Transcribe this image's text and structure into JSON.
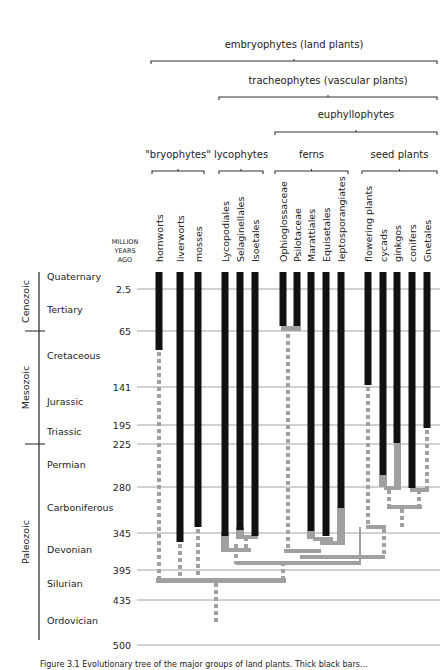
{
  "clades": [
    {
      "id": "embryophytes",
      "label": "embryophytes (land plants)",
      "x1": 151,
      "x2": 437,
      "y": 61,
      "label_y": 48
    },
    {
      "id": "tracheophytes",
      "label": "tracheophytes (vascular plants)",
      "x1": 219,
      "x2": 437,
      "y": 97,
      "label_y": 84
    },
    {
      "id": "euphyllophytes",
      "label": "euphyllophytes",
      "x1": 275,
      "x2": 437,
      "y": 132,
      "label_y": 118
    },
    {
      "id": "bryophytes",
      "label": "\"bryophytes\"",
      "x1": 152,
      "x2": 204,
      "y": 171,
      "label_y": 158
    },
    {
      "id": "lycophytes",
      "label": "lycophytes",
      "x1": 219,
      "x2": 263,
      "y": 171,
      "label_y": 158
    },
    {
      "id": "ferns",
      "label": "ferns",
      "x1": 275,
      "x2": 348,
      "y": 171,
      "label_y": 158
    },
    {
      "id": "seed-plants",
      "label": "seed plants",
      "x1": 362,
      "x2": 437,
      "y": 171,
      "label_y": 158
    }
  ],
  "axis": {
    "header": [
      "MILLION",
      "YEARS",
      "AGO"
    ],
    "ticks": [
      {
        "label": "2.5",
        "y": 289
      },
      {
        "label": "65",
        "y": 331
      },
      {
        "label": "141",
        "y": 387
      },
      {
        "label": "195",
        "y": 425
      },
      {
        "label": "225",
        "y": 444
      },
      {
        "label": "280",
        "y": 487
      },
      {
        "label": "345",
        "y": 533
      },
      {
        "label": "395",
        "y": 570
      },
      {
        "label": "435",
        "y": 600
      },
      {
        "label": "500",
        "y": 645
      }
    ]
  },
  "eras": [
    {
      "label": "Cenozoic",
      "y1": 272,
      "y2": 331
    },
    {
      "label": "Mesozoic",
      "y1": 331,
      "y2": 444
    },
    {
      "label": "Paleozoic",
      "y1": 444,
      "y2": 640
    }
  ],
  "periods": [
    {
      "label": "Quaternary",
      "y": 280
    },
    {
      "label": "Tertiary",
      "y": 313
    },
    {
      "label": "Cretaceous",
      "y": 359
    },
    {
      "label": "Jurassic",
      "y": 405
    },
    {
      "label": "Triassic",
      "y": 435
    },
    {
      "label": "Permian",
      "y": 468
    },
    {
      "label": "Carboniferous",
      "y": 511
    },
    {
      "label": "Devonian",
      "y": 553
    },
    {
      "label": "Silurian",
      "y": 587
    },
    {
      "label": "Ordovician",
      "y": 624
    }
  ],
  "taxa": [
    {
      "label": "hornworts",
      "x": 159,
      "bar_end": 350
    },
    {
      "label": "liverworts",
      "x": 180,
      "bar_end": 542
    },
    {
      "label": "mosses",
      "x": 198,
      "bar_end": 527
    },
    {
      "label": "Lycopodiales",
      "x": 225,
      "bar_end": 536
    },
    {
      "label": "Selaginellales",
      "x": 240,
      "bar_end": 530
    },
    {
      "label": "Isoetales",
      "x": 255,
      "bar_end": 536
    },
    {
      "label": "Ophioglossaceae",
      "x": 283,
      "bar_end": 326
    },
    {
      "label": "Psilotaceae",
      "x": 297,
      "bar_end": 326
    },
    {
      "label": "Marattiales",
      "x": 311,
      "bar_end": 531
    },
    {
      "label": "Equisetales",
      "x": 326,
      "bar_end": 536
    },
    {
      "label": "leptosporangiates",
      "x": 341,
      "bar_end": 508
    },
    {
      "label": "flowering plants",
      "x": 368,
      "bar_end": 385
    },
    {
      "label": "cycads",
      "x": 383,
      "bar_end": 475
    },
    {
      "label": "ginkgos",
      "x": 397,
      "bar_end": 443
    },
    {
      "label": "conifers",
      "x": 412,
      "bar_end": 488
    },
    {
      "label": "Gnetales",
      "x": 427,
      "bar_end": 428
    }
  ],
  "colors": {
    "bar": "#111111",
    "branch": "#a0a0a0",
    "gridline": "#8a8a8a",
    "bracket": "#333333"
  },
  "caption": "Figure 3.1  Evolutionary tree of the major groups of land plants. Thick black bars..."
}
